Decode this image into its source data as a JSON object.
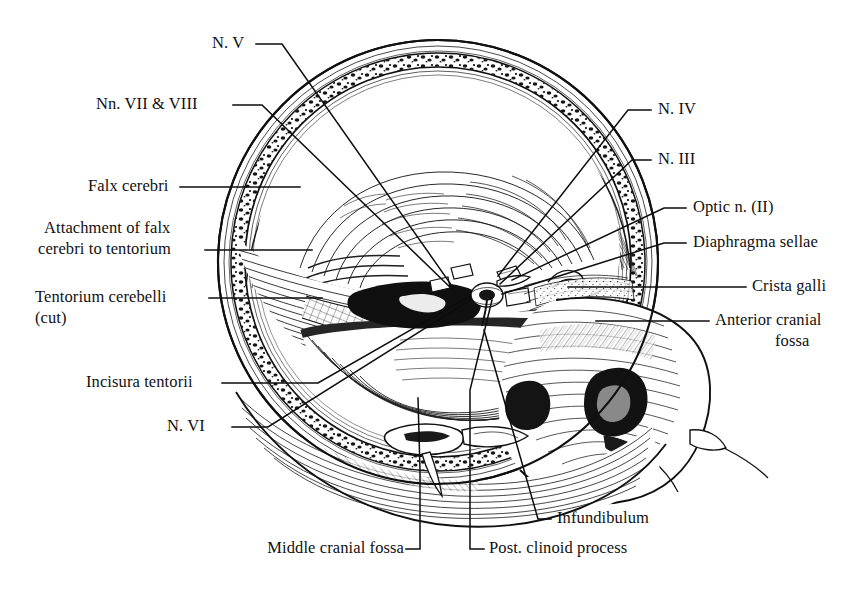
{
  "figure": {
    "kind": "anatomical-illustration",
    "style": "black-and-white line engraving / cross-hatch stipple",
    "background_color": "#ffffff",
    "ink_color": "#101010",
    "width": 866,
    "height": 589
  },
  "labels": {
    "n_v": "N. V",
    "nn_vii_viii": "Nn. VII & VIII",
    "falx_cerebri": "Falx cerebri",
    "attachment_line1": "Attachment of falx",
    "attachment_line2": "cerebri to tentorium",
    "tentorium_line1": "Tentorium cerebelli",
    "tentorium_line2": "(cut)",
    "incisura_tentorii": "Incisura tentorii",
    "n_vi": "N. VI",
    "n_iv": "N. IV",
    "n_iii": "N. III",
    "optic_n": "Optic n. (II)",
    "diaphragma_sellae": "Diaphragma sellae",
    "crista_galli": "Crista galli",
    "anterior_fossa_line1": "Anterior cranial",
    "anterior_fossa_line2": "fossa",
    "infundibulum": "Infundibulum",
    "post_clinoid": "Post. clinoid process",
    "middle_cranial_fossa": "Middle cranial fossa"
  }
}
